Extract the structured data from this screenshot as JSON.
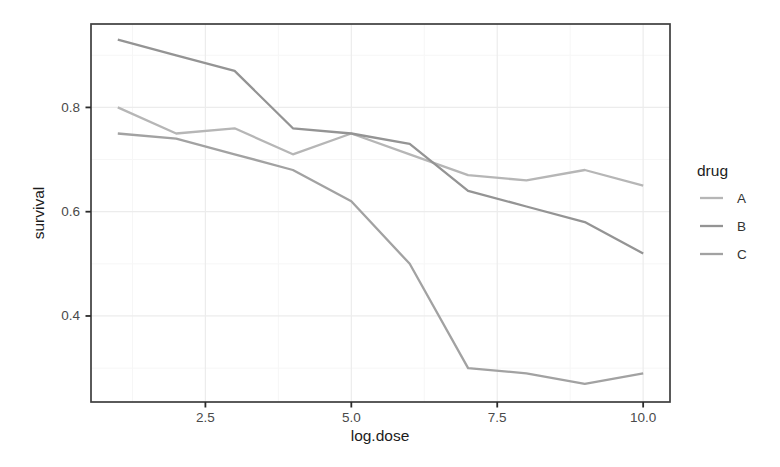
{
  "chart_data": {
    "type": "line",
    "title": "",
    "xlabel": "log.dose",
    "ylabel": "survival",
    "x": [
      1,
      2,
      3,
      4,
      5,
      6,
      7,
      8,
      9,
      10
    ],
    "series": [
      {
        "name": "A",
        "color": "#b6b6b6",
        "values": [
          0.8,
          0.75,
          0.76,
          0.71,
          0.75,
          0.71,
          0.67,
          0.66,
          0.68,
          0.65
        ]
      },
      {
        "name": "B",
        "color": "#949494",
        "values": [
          0.93,
          0.9,
          0.87,
          0.76,
          0.75,
          0.73,
          0.64,
          0.61,
          0.58,
          0.52
        ]
      },
      {
        "name": "C",
        "color": "#a2a2a2",
        "values": [
          0.75,
          0.74,
          0.71,
          0.68,
          0.62,
          0.5,
          0.3,
          0.29,
          0.27,
          0.29
        ]
      }
    ],
    "x_ticks": {
      "values": [
        2.5,
        5.0,
        7.5,
        10.0
      ],
      "labels": [
        "2.5",
        "5.0",
        "7.5",
        "10.0"
      ]
    },
    "y_ticks": {
      "values": [
        0.8,
        0.6,
        0.4
      ],
      "labels": [
        "0.8",
        "0.6",
        "0.4"
      ]
    },
    "x_minor": [
      1.25,
      3.75,
      6.25,
      8.75
    ],
    "y_minor": [
      0.3,
      0.5,
      0.7,
      0.9
    ],
    "xlim": [
      0.54,
      10.46
    ],
    "ylim": [
      0.235,
      0.96
    ],
    "grid": true,
    "legend": {
      "title": "drug",
      "position": "right",
      "entries": [
        "A",
        "B",
        "C"
      ]
    },
    "theme": {
      "background": "#ffffff",
      "panel_border": "#3e3e3e",
      "grid_major": "#ececec",
      "grid_minor": "#f6f6f6",
      "tick_color": "#2b2b2b",
      "tick_label_color": "#4a4a4a",
      "axis_title_color": "#1c1c1c",
      "legend_text_color": "#333333"
    }
  }
}
